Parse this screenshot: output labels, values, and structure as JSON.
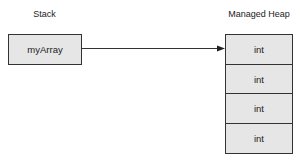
{
  "diagram": {
    "stack": {
      "title": "Stack",
      "items": [
        {
          "label": "myArray"
        }
      ]
    },
    "heap": {
      "title": "Managed Heap",
      "cells": [
        {
          "label": "int"
        },
        {
          "label": "int"
        },
        {
          "label": "int"
        },
        {
          "label": "int"
        }
      ]
    },
    "connections": [
      {
        "from": "stack.items.0",
        "to": "heap.cells.0",
        "style": "arrow"
      }
    ],
    "colors": {
      "box_fill": "#e6e6e6",
      "border": "#333333",
      "text": "#222222",
      "background": "#ffffff"
    }
  }
}
